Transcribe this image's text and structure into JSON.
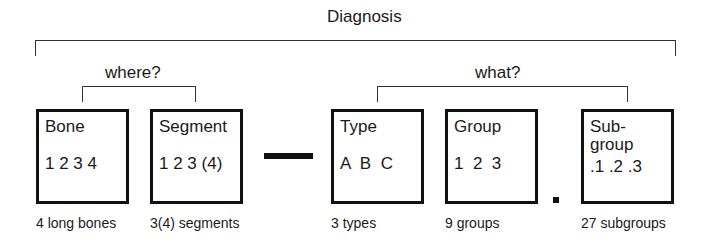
{
  "diagram": {
    "top_label": "Diagnosis",
    "where_label": "where?",
    "what_label": "what?",
    "boxes": [
      {
        "title": "Bone",
        "values": "1 2 3 4",
        "caption": "4 long bones"
      },
      {
        "title": "Segment",
        "values": "1 2 3 (4)",
        "caption": "3(4) segments"
      },
      {
        "title": "Type",
        "values": "A  B  C",
        "caption": "3 types"
      },
      {
        "title": "Group",
        "values": "1  2  3",
        "caption": "9 groups"
      },
      {
        "title_line1": "Sub-",
        "title_line2": "group",
        "values": ".1 .2 .3",
        "caption": "27 subgroups"
      }
    ],
    "separators": {
      "dash": "—",
      "dot": "."
    }
  }
}
